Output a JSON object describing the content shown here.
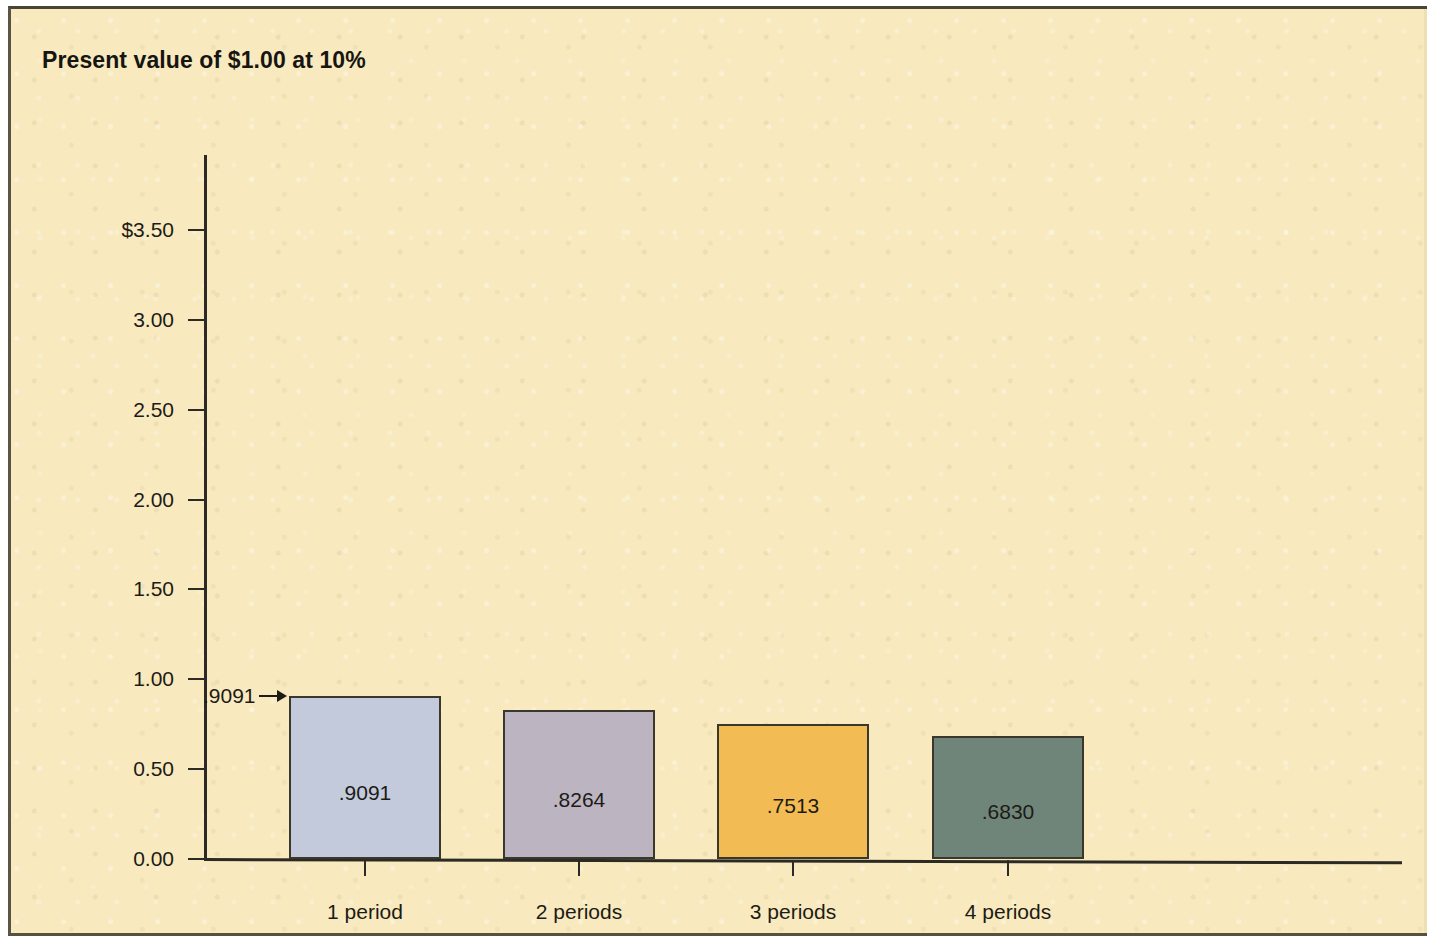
{
  "chart_data": {
    "type": "bar",
    "title": "Present value of $1.00 at 10%",
    "xlabel": "",
    "ylabel": "",
    "categories": [
      "1 period",
      "2 periods",
      "3 periods",
      "4 periods"
    ],
    "values": [
      0.9091,
      0.8264,
      0.7513,
      0.683
    ],
    "value_labels": [
      ".9091",
      ".8264",
      ".7513",
      ".6830"
    ],
    "ylim": [
      0.0,
      3.5
    ],
    "y_ticks": [
      0.0,
      0.5,
      1.0,
      1.5,
      2.0,
      2.5,
      3.0,
      3.5
    ],
    "y_tick_labels": [
      "0.00",
      "0.50",
      "1.00",
      "1.50",
      "2.00",
      "2.50",
      "3.00",
      "$3.50"
    ],
    "grid": false,
    "legend": "none",
    "bar_colors": [
      "#c2cadc",
      "#bcb5c1",
      "#f3bb53",
      "#6f8579"
    ],
    "bar_border_color": "#3a372c",
    "annotations": [
      {
        "text": ".9091",
        "target_category": "1 period",
        "arrow": "right"
      }
    ]
  },
  "figure": {
    "background_color": "#f8eabe",
    "border_color": "#4a4438",
    "axis_color": "#2b2a24",
    "text_color": "#1d1b16"
  }
}
